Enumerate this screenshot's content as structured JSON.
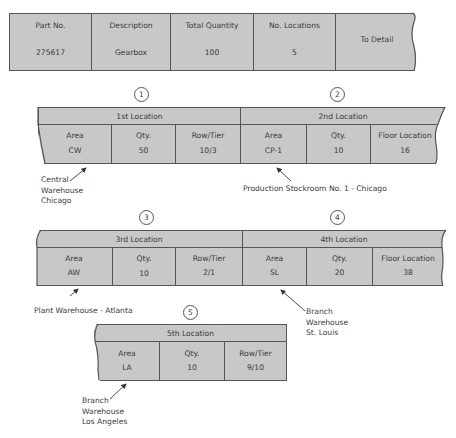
{
  "header_card": {
    "columns": [
      {
        "label": "Part No.",
        "value": "275617"
      },
      {
        "label": "Description",
        "value": "Gearbox"
      },
      {
        "label": "Total Quantity",
        "value": "100"
      },
      {
        "label": "No. Locations",
        "value": "5"
      }
    ],
    "link_label": "To Detail"
  },
  "locations": [
    {
      "number": "1",
      "title": "1st Location",
      "fields": [
        {
          "label": "Area",
          "value": "CW"
        },
        {
          "label": "Qty.",
          "value": "50"
        },
        {
          "label": "Row/Tier",
          "value": "10/3"
        }
      ],
      "note": "Central\nWarehouse\nChicago"
    },
    {
      "number": "2",
      "title": "2nd Location",
      "fields": [
        {
          "label": "Area",
          "value": "CP-1"
        },
        {
          "label": "Qty.",
          "value": "10"
        },
        {
          "label": "Floor Location",
          "value": "16"
        }
      ],
      "note": "Production Stockroom No. 1 - Chicago"
    },
    {
      "number": "3",
      "title": "3rd Location",
      "fields": [
        {
          "label": "Area",
          "value": "AW"
        },
        {
          "label": "Qty.",
          "value": "10"
        },
        {
          "label": "Row/Tier",
          "value": "2/1"
        }
      ],
      "note": "Plant Warehouse - Atlanta"
    },
    {
      "number": "4",
      "title": "4th Location",
      "fields": [
        {
          "label": "Area",
          "value": "SL"
        },
        {
          "label": "Qty.",
          "value": "20"
        },
        {
          "label": "Floor Location",
          "value": "38"
        }
      ],
      "note": "Branch\nWarehouse\nSt. Louis"
    },
    {
      "number": "5",
      "title": "5th Location",
      "fields": [
        {
          "label": "Area",
          "value": "LA"
        },
        {
          "label": "Qty.",
          "value": "10"
        },
        {
          "label": "Row/Tier",
          "value": "9/10"
        }
      ],
      "note": "Branch\nWarehouse\nLos Angeles"
    }
  ],
  "colors": {
    "card_fill": "#c8c8c8",
    "border": "#555555",
    "text": "#3a3a3a"
  }
}
